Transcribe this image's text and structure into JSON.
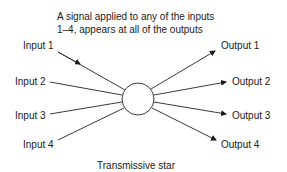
{
  "diagram": {
    "annotation_line1": "A signal applied to any of the inputs",
    "annotation_line2": "1–4, appears at all of the outputs",
    "caption": "Transmissive star",
    "inputs": [
      "Input 1",
      "Input 2",
      "Input 3",
      "Input 4"
    ],
    "outputs": [
      "Output 1",
      "Output 2",
      "Output 3",
      "Output 4"
    ],
    "hub": "star-coupler-circle",
    "line_color": "#3a3a3a"
  }
}
